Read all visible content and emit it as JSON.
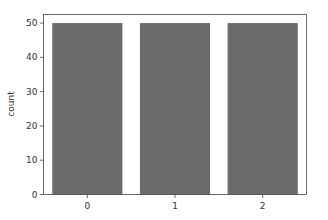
{
  "chart_data": {
    "type": "bar",
    "title": "",
    "xlabel": "",
    "ylabel": "count",
    "categories": [
      "0",
      "1",
      "2"
    ],
    "values": [
      50,
      50,
      50
    ],
    "ylim": [
      0,
      52.5
    ],
    "yticks": [
      0,
      10,
      20,
      30,
      40,
      50
    ],
    "grid": false,
    "legend": null,
    "bar_color": "#6b6b6b"
  }
}
